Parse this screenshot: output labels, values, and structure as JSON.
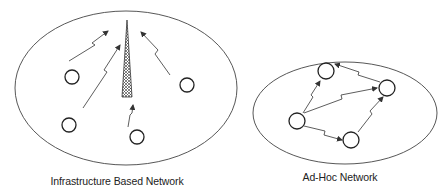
{
  "diagram": {
    "type": "network-comparison",
    "colors": {
      "stroke": "#333333",
      "background": "#ffffff",
      "text": "#222222"
    },
    "panels": [
      {
        "id": "infrastructure",
        "label": "Infrastructure Based Network",
        "central_element": "cell-tower",
        "nodes": 4,
        "links": "wireless links from each node to the tower"
      },
      {
        "id": "adhoc",
        "label": "Ad-Hoc Network",
        "central_element": null,
        "nodes": 4,
        "links": "peer-to-peer wireless links between nodes"
      }
    ]
  }
}
